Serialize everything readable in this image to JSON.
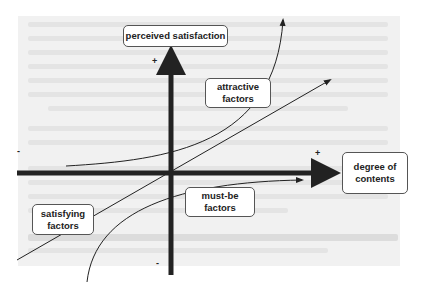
{
  "diagram": {
    "title_concept": "Kano model",
    "y_axis_label": "perceived satisfaction",
    "x_axis_label_line1": "degree of",
    "x_axis_label_line2": "contents",
    "curves": [
      {
        "label_line1": "attractive",
        "label_line2": "factors"
      },
      {
        "label_line1": "satisfying",
        "label_line2": "factors"
      },
      {
        "label_line1": "must-be",
        "label_line2": "factors"
      }
    ],
    "signs": {
      "y_plus": "+",
      "y_minus": "-",
      "x_plus": "+",
      "x_minus": "-"
    },
    "colors": {
      "axis": "#222222",
      "box_border": "#555555",
      "background_text": "#e4e4e4"
    }
  }
}
